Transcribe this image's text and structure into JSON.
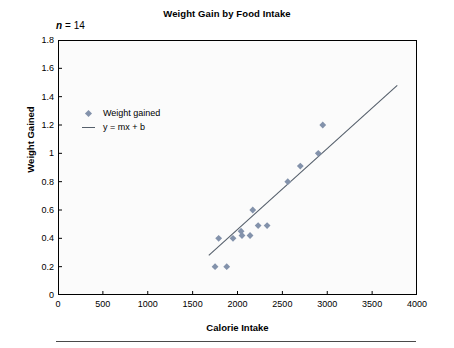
{
  "chart_data": {
    "type": "scatter",
    "title": "Weight Gain by Food Intake",
    "xlabel": "Calorie Intake",
    "ylabel": "Weight Gained",
    "xlim": [
      0,
      4000
    ],
    "ylim": [
      0,
      1.8
    ],
    "xticks": [
      0,
      500,
      1000,
      1500,
      2000,
      2500,
      3000,
      3500,
      4000
    ],
    "yticks": [
      0,
      0.2,
      0.4,
      0.6,
      0.8,
      1,
      1.2,
      1.4,
      1.6,
      1.8
    ],
    "xtick_labels": [
      "0",
      "500",
      "1000",
      "1500",
      "2000",
      "2500",
      "3000",
      "3500",
      "4000"
    ],
    "ytick_labels": [
      "0",
      "0.2",
      "0.4",
      "0.6",
      "0.8",
      "1",
      "1.2",
      "1.4",
      "1.6",
      "1.8"
    ],
    "grid": false,
    "legend_position": "upper-left-inside",
    "annotation": {
      "symbol": "n",
      "equals": "=",
      "value": "14"
    },
    "series": [
      {
        "name": "Weight gained",
        "type": "scatter",
        "marker": "diamond",
        "color": "#8392ab",
        "points": [
          {
            "x": 1750,
            "y": 0.2
          },
          {
            "x": 1880,
            "y": 0.2
          },
          {
            "x": 1790,
            "y": 0.4
          },
          {
            "x": 1950,
            "y": 0.4
          },
          {
            "x": 2050,
            "y": 0.42
          },
          {
            "x": 2040,
            "y": 0.45
          },
          {
            "x": 2140,
            "y": 0.42
          },
          {
            "x": 2170,
            "y": 0.6
          },
          {
            "x": 2230,
            "y": 0.49
          },
          {
            "x": 2330,
            "y": 0.49
          },
          {
            "x": 2560,
            "y": 0.8
          },
          {
            "x": 2700,
            "y": 0.91
          },
          {
            "x": 2900,
            "y": 1.0
          },
          {
            "x": 2950,
            "y": 1.2
          }
        ]
      },
      {
        "name": "y = mx + b",
        "type": "line",
        "color": "#555f6b",
        "endpoints": [
          {
            "x": 1680,
            "y": 0.28
          },
          {
            "x": 3780,
            "y": 1.48
          }
        ]
      }
    ]
  },
  "legend": {
    "items": [
      {
        "label": "Weight gained",
        "key": "diamond"
      },
      {
        "label": "y = mx + b",
        "key": "line"
      }
    ]
  }
}
